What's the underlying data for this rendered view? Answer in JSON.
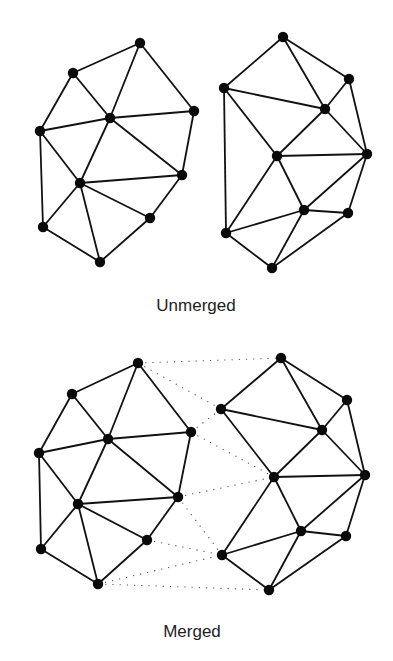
{
  "captions": {
    "top": "Unmerged",
    "bottom": "Merged"
  },
  "colors": {
    "edge": "#111111",
    "node": "#0a0a0a",
    "merge_edge": "#555555"
  },
  "diagrams": {
    "unmerged": {
      "left": {
        "nodes": {
          "A": [
            140,
            43
          ],
          "B": [
            73,
            73
          ],
          "C": [
            110,
            118
          ],
          "D": [
            194,
            111
          ],
          "E": [
            40,
            131
          ],
          "F": [
            80,
            183
          ],
          "G": [
            182,
            175
          ],
          "H": [
            150,
            218
          ],
          "I": [
            43,
            227
          ],
          "J": [
            100,
            262
          ]
        },
        "edges": [
          [
            "A",
            "B"
          ],
          [
            "A",
            "C"
          ],
          [
            "A",
            "D"
          ],
          [
            "B",
            "C"
          ],
          [
            "B",
            "E"
          ],
          [
            "E",
            "C"
          ],
          [
            "C",
            "D"
          ],
          [
            "C",
            "F"
          ],
          [
            "C",
            "G"
          ],
          [
            "D",
            "G"
          ],
          [
            "E",
            "F"
          ],
          [
            "E",
            "I"
          ],
          [
            "F",
            "I"
          ],
          [
            "F",
            "G"
          ],
          [
            "F",
            "H"
          ],
          [
            "F",
            "J"
          ],
          [
            "G",
            "H"
          ],
          [
            "H",
            "J"
          ],
          [
            "I",
            "J"
          ]
        ]
      },
      "right": {
        "nodes": {
          "a": [
            283,
            37
          ],
          "b": [
            349,
            79
          ],
          "c": [
            224,
            88
          ],
          "d": [
            325,
            109
          ],
          "e": [
            367,
            154
          ],
          "f": [
            277,
            156
          ],
          "g": [
            304,
            210
          ],
          "h": [
            348,
            213
          ],
          "i": [
            226,
            233
          ],
          "j": [
            272,
            268
          ]
        },
        "edges": [
          [
            "a",
            "c"
          ],
          [
            "a",
            "d"
          ],
          [
            "a",
            "b"
          ],
          [
            "c",
            "d"
          ],
          [
            "b",
            "d"
          ],
          [
            "b",
            "e"
          ],
          [
            "d",
            "e"
          ],
          [
            "c",
            "f"
          ],
          [
            "d",
            "f"
          ],
          [
            "f",
            "e"
          ],
          [
            "c",
            "i"
          ],
          [
            "f",
            "i"
          ],
          [
            "f",
            "g"
          ],
          [
            "e",
            "g"
          ],
          [
            "e",
            "h"
          ],
          [
            "g",
            "h"
          ],
          [
            "i",
            "g"
          ],
          [
            "g",
            "j"
          ],
          [
            "i",
            "j"
          ],
          [
            "h",
            "j"
          ]
        ]
      }
    },
    "merged": {
      "left": {
        "nodes": {
          "A": [
            138,
            363
          ],
          "B": [
            72,
            394
          ],
          "C": [
            108,
            439
          ],
          "D": [
            191,
            432
          ],
          "E": [
            39,
            453
          ],
          "F": [
            78,
            504
          ],
          "G": [
            178,
            497
          ],
          "H": [
            147,
            540
          ],
          "I": [
            41,
            549
          ],
          "J": [
            98,
            584
          ]
        },
        "edges": [
          [
            "A",
            "B"
          ],
          [
            "A",
            "C"
          ],
          [
            "A",
            "D"
          ],
          [
            "B",
            "C"
          ],
          [
            "B",
            "E"
          ],
          [
            "E",
            "C"
          ],
          [
            "C",
            "D"
          ],
          [
            "C",
            "F"
          ],
          [
            "C",
            "G"
          ],
          [
            "D",
            "G"
          ],
          [
            "E",
            "F"
          ],
          [
            "E",
            "I"
          ],
          [
            "F",
            "I"
          ],
          [
            "F",
            "G"
          ],
          [
            "F",
            "H"
          ],
          [
            "F",
            "J"
          ],
          [
            "G",
            "H"
          ],
          [
            "H",
            "J"
          ],
          [
            "I",
            "J"
          ]
        ]
      },
      "right": {
        "nodes": {
          "a": [
            281,
            358
          ],
          "b": [
            347,
            400
          ],
          "c": [
            221,
            409
          ],
          "d": [
            322,
            430
          ],
          "e": [
            365,
            475
          ],
          "f": [
            274,
            477
          ],
          "g": [
            301,
            531
          ],
          "h": [
            346,
            536
          ],
          "i": [
            222,
            555
          ],
          "j": [
            269,
            590
          ]
        },
        "edges": [
          [
            "a",
            "c"
          ],
          [
            "a",
            "d"
          ],
          [
            "a",
            "b"
          ],
          [
            "c",
            "d"
          ],
          [
            "b",
            "d"
          ],
          [
            "b",
            "e"
          ],
          [
            "d",
            "e"
          ],
          [
            "c",
            "f"
          ],
          [
            "d",
            "f"
          ],
          [
            "f",
            "e"
          ],
          [
            "f",
            "i"
          ],
          [
            "f",
            "g"
          ],
          [
            "e",
            "g"
          ],
          [
            "e",
            "h"
          ],
          [
            "g",
            "h"
          ],
          [
            "i",
            "g"
          ],
          [
            "g",
            "j"
          ],
          [
            "i",
            "j"
          ],
          [
            "h",
            "j"
          ]
        ]
      },
      "merge_edges": [
        [
          "A",
          "a"
        ],
        [
          "A",
          "c"
        ],
        [
          "D",
          "c"
        ],
        [
          "D",
          "f"
        ],
        [
          "G",
          "f"
        ],
        [
          "G",
          "i"
        ],
        [
          "H",
          "i"
        ],
        [
          "J",
          "i"
        ],
        [
          "J",
          "j"
        ]
      ]
    }
  }
}
